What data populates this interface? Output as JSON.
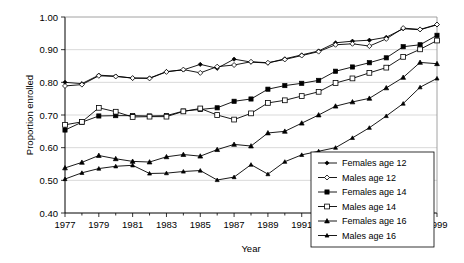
{
  "chart_data": {
    "type": "line",
    "title": "",
    "xlabel": "Year",
    "ylabel": "Proportion enrolled",
    "ylim": [
      0.4,
      1.0
    ],
    "ytick_step": 0.1,
    "ytick_labels": [
      "0.40",
      "0.50",
      "0.60",
      "0.70",
      "0.80",
      "0.90",
      "1.00"
    ],
    "xlim": [
      1977,
      1999
    ],
    "xtick_labels": [
      "1977",
      "1979",
      "1981",
      "1983",
      "1985",
      "1987",
      "1989",
      "1991",
      "1993",
      "1995",
      "1997",
      "1999"
    ],
    "xtick_step": 2,
    "minor_xticks": true,
    "grid": "horizontal",
    "legend_position": "bottom-right",
    "x": [
      1977,
      1978,
      1979,
      1980,
      1981,
      1982,
      1983,
      1984,
      1985,
      1986,
      1987,
      1988,
      1989,
      1990,
      1991,
      1992,
      1993,
      1994,
      1995,
      1996,
      1997,
      1998,
      1999
    ],
    "series": [
      {
        "name": "Females age 12",
        "marker": "filled-diamond",
        "values": [
          0.8,
          0.796,
          0.822,
          0.819,
          0.813,
          0.813,
          0.833,
          0.838,
          0.855,
          0.843,
          0.871,
          0.862,
          0.859,
          0.872,
          0.884,
          0.896,
          0.921,
          0.926,
          0.929,
          0.938,
          0.964,
          0.961,
          0.976
        ]
      },
      {
        "name": "Males age 12",
        "marker": "open-diamond",
        "values": [
          0.789,
          0.793,
          0.82,
          0.818,
          0.813,
          0.812,
          0.832,
          0.839,
          0.829,
          0.848,
          0.853,
          0.863,
          0.86,
          0.87,
          0.882,
          0.894,
          0.915,
          0.918,
          0.911,
          0.933,
          0.966,
          0.962,
          0.977
        ]
      },
      {
        "name": "Females age 14",
        "marker": "filled-square",
        "values": [
          0.654,
          0.678,
          0.697,
          0.698,
          0.698,
          0.697,
          0.698,
          0.712,
          0.717,
          0.722,
          0.742,
          0.749,
          0.779,
          0.79,
          0.797,
          0.806,
          0.834,
          0.847,
          0.86,
          0.875,
          0.909,
          0.915,
          0.944
        ]
      },
      {
        "name": "Males age 14",
        "marker": "open-square",
        "values": [
          0.67,
          0.679,
          0.722,
          0.71,
          0.694,
          0.695,
          0.695,
          0.711,
          0.72,
          0.7,
          0.686,
          0.705,
          0.737,
          0.745,
          0.758,
          0.771,
          0.798,
          0.812,
          0.829,
          0.845,
          0.878,
          0.901,
          0.928
        ]
      },
      {
        "name": "Females age 16",
        "marker": "filled-triangle",
        "values": [
          0.538,
          0.555,
          0.576,
          0.566,
          0.558,
          0.556,
          0.572,
          0.579,
          0.574,
          0.594,
          0.61,
          0.605,
          0.645,
          0.65,
          0.675,
          0.7,
          0.727,
          0.74,
          0.751,
          0.783,
          0.815,
          0.861,
          0.857
        ]
      },
      {
        "name": "Males age 16",
        "marker": "filled-triangle-small",
        "values": [
          0.504,
          0.523,
          0.536,
          0.543,
          0.546,
          0.521,
          0.522,
          0.527,
          0.53,
          0.501,
          0.51,
          0.548,
          0.519,
          0.557,
          0.578,
          0.589,
          0.6,
          0.63,
          0.661,
          0.697,
          0.735,
          0.785,
          0.812
        ]
      }
    ]
  },
  "legend": {
    "entries": [
      "Females age 12",
      "Males age 12",
      "Females age 14",
      "Males age 14",
      "Females age 16",
      "Males age 16"
    ]
  }
}
